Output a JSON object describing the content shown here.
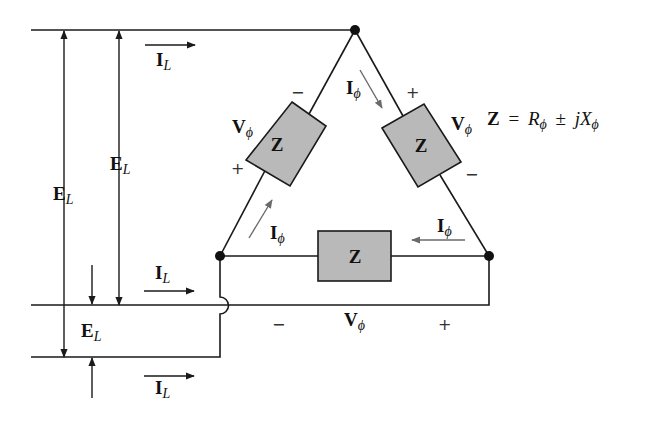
{
  "diagram": {
    "type": "delta-connected three-phase load",
    "impedance_label": "Z",
    "formula": {
      "lhs": "Z",
      "eq": "=",
      "r": "R",
      "r_sub": "ϕ",
      "pm": "±",
      "jx": "jX",
      "x_sub": "ϕ"
    },
    "line_voltage": {
      "main": "E",
      "sub": "L"
    },
    "line_current": {
      "main": "I",
      "sub": "L"
    },
    "phase_current": {
      "main": "I",
      "sub": "ϕ"
    },
    "phase_voltage": {
      "main": "V",
      "sub": "ϕ"
    },
    "plus": "+",
    "minus": "−",
    "colors": {
      "wire": "#1a1a1a",
      "impedance_fill": "#b9b9b9",
      "phase_arrow": "#6a6a6a",
      "background": "#ffffff"
    }
  }
}
